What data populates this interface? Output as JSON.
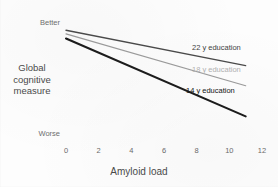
{
  "chart_data": {
    "type": "line",
    "title": "",
    "xlabel": "Amyloid load",
    "ylabel": "Global cognitive measure",
    "xlim": [
      0,
      12
    ],
    "ylim": [
      0,
      1
    ],
    "grid": false,
    "legend_position": "inline-right-of-line",
    "x_ticks": [
      "0",
      "2",
      "4",
      "6",
      "8",
      "10",
      "12"
    ],
    "y_ticks": [],
    "y_qualitative_labels": {
      "top": "Better",
      "bottom": "Worse"
    },
    "x": [
      0,
      11
    ],
    "series": [
      {
        "name": "22 y education",
        "label": "22 y education",
        "values": [
          0.93,
          0.63
        ],
        "slope": -0.0273,
        "color": "#4a4a4a",
        "stroke_width": 1.3
      },
      {
        "name": "18 y education",
        "label": "18 y education",
        "values": [
          0.9,
          0.46
        ],
        "slope": -0.04,
        "color": "#9a9a9a",
        "stroke_width": 1.2
      },
      {
        "name": "14 y education",
        "label": "14 y education",
        "values": [
          0.86,
          0.2
        ],
        "slope": -0.06,
        "color": "#1c1c1c",
        "stroke_width": 2.1
      }
    ],
    "annotations": [
      {
        "text": "22 y education",
        "x": 8.0,
        "y": 0.72
      },
      {
        "text": "18 y education",
        "x": 8.0,
        "y": 0.56
      },
      {
        "text": "14 y education",
        "x": 7.6,
        "y": 0.38
      }
    ]
  },
  "axis": {
    "x_tick_labels": [
      "0",
      "2",
      "4",
      "6",
      "8",
      "10",
      "12"
    ],
    "x_title": "Amyloid load",
    "y_title_line1": "Global",
    "y_title_line2": "cognitive",
    "y_title_line3": "measure",
    "y_top_label": "Better",
    "y_bottom_label": "Worse"
  },
  "colors": {
    "background": "#fdfdfd",
    "axis_text": "#4a4a4a",
    "tick_text": "#6a6a6a",
    "line_22y": "#4a4a4a",
    "line_18y": "#9a9a9a",
    "line_14y": "#1c1c1c"
  }
}
